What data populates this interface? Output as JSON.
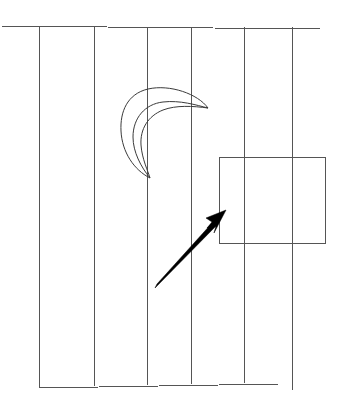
{
  "scene": {
    "title": "Line drawing with crescent, rectangle and arrow",
    "width": 339,
    "height": 413,
    "background_color": "#ffffff",
    "description": "A sketch-style diagram of vertical ruled lines with a hand-drawn crescent moon, an empty rectangle and a thick black arrow pointing up-right toward the rectangle."
  },
  "colors": {
    "grid_stroke": "#555555",
    "outline_stroke": "#3a3a3a",
    "arrow_fill": "#000000",
    "background": "#ffffff"
  },
  "grid": {
    "name": "ruled-vertical-lines",
    "vertical_line_count": 6,
    "vertical_lines": [
      {
        "label": "vertical-line-1",
        "x": 39,
        "y1": 27,
        "y2": 388
      },
      {
        "label": "vertical-line-2",
        "x": 94,
        "y1": 27,
        "y2": 386
      },
      {
        "label": "vertical-line-3",
        "x": 147,
        "y1": 27,
        "y2": 385
      },
      {
        "label": "vertical-line-4",
        "x": 191,
        "y1": 27,
        "y2": 384
      },
      {
        "label": "vertical-line-5",
        "x": 244,
        "y1": 27,
        "y2": 383
      },
      {
        "label": "vertical-line-6",
        "x": 292,
        "y1": 27,
        "y2": 390
      }
    ],
    "horizontal_lines": [
      {
        "label": "top-horizontal-line",
        "x1": 0,
        "x2": 320,
        "y1": 26,
        "y2": 29
      },
      {
        "label": "bottom-horizontal-line",
        "x1": 39,
        "x2": 279,
        "y1": 388,
        "y2": 384
      }
    ]
  },
  "shapes": {
    "crescent": {
      "name": "crescent-moon",
      "bounds": {
        "x": 120,
        "y": 87,
        "width": 89,
        "height": 92
      },
      "opening_direction": "upper-right",
      "path": "M 208 108 C 198 94 170 84 148 89 C 127 94 120 112 121 131 C 122 152 134 170 150 178 C 141 167 133 152 133 137 C 133 118 145 104 163 102 C 180 100 196 105 208 108 Z",
      "inner_path": "M 208 108 C 193 106 176 105 163 110 C 148 116 140 129 141 145 C 142 159 148 171 150 178"
    },
    "rectangle": {
      "name": "empty-rectangle",
      "x": 219,
      "y": 157,
      "width": 106,
      "height": 86
    },
    "arrow": {
      "name": "pointing-arrow",
      "tail_x": 155,
      "tail_y": 288,
      "tip_x": 226,
      "tip_y": 210,
      "direction": "up-right",
      "target": "empty-rectangle",
      "shaft_path": "M 155 288 L 157 284 L 213 222 L 216 226 Z",
      "head_path": "M 226 210 L 206 218 L 212 222 L 207 228 L 216 226 L 214 233 Z"
    }
  }
}
